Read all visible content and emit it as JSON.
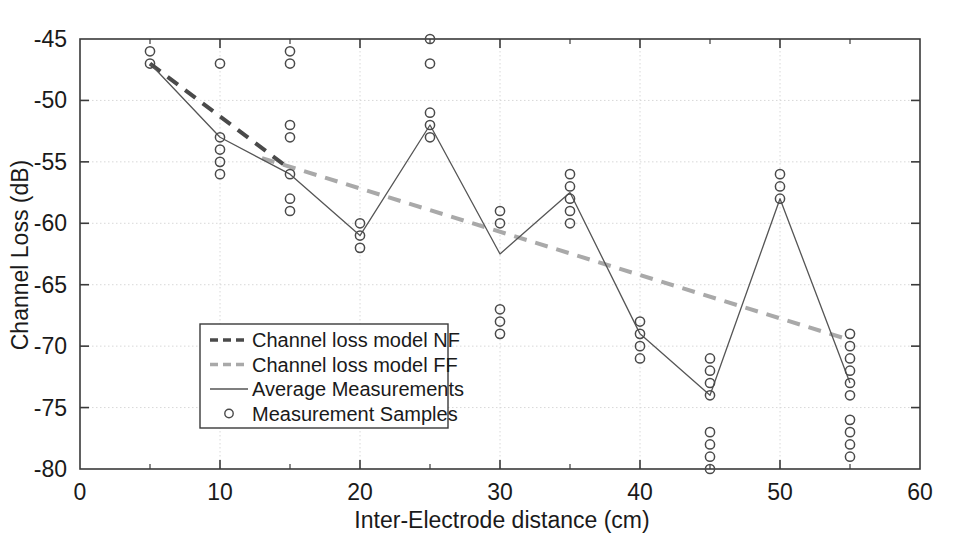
{
  "figure": {
    "background": "#ffffff",
    "plot_border_color": "#3a3a3a",
    "grid_color": "#d8d8d8"
  },
  "chart_data": {
    "type": "scatter",
    "title": "",
    "xlabel": "Inter-Electrode distance (cm)",
    "ylabel": "Channel Loss (dB)",
    "xlim": [
      0,
      60
    ],
    "ylim": [
      -80,
      -45
    ],
    "xticks": [
      0,
      10,
      20,
      30,
      40,
      50,
      60
    ],
    "xtick_labels": [
      "0",
      "10",
      "20",
      "30",
      "40",
      "50",
      "60"
    ],
    "yticks": [
      -80,
      -75,
      -70,
      -65,
      -60,
      -55,
      -50,
      -45
    ],
    "ytick_labels": [
      "-80",
      "-75",
      "-70",
      "-65",
      "-60",
      "-55",
      "-50",
      "-45"
    ],
    "xminor_ticks": [
      5,
      15,
      25,
      35,
      45,
      55
    ],
    "grid": true,
    "legend_position": "lower-left-inside",
    "series": [
      {
        "name": "Channel loss model NF",
        "type": "line",
        "style": "dashed",
        "color": "#4a4a4a",
        "width": 4,
        "x": [
          5,
          15
        ],
        "values": [
          -47.0,
          -55.6
        ]
      },
      {
        "name": "Channel loss model FF",
        "type": "line",
        "style": "dashed",
        "color": "#a9a9a9",
        "width": 4,
        "x": [
          13,
          55
        ],
        "values": [
          -54.7,
          -69.5
        ]
      },
      {
        "name": "Average Measurements",
        "type": "line",
        "style": "solid",
        "color": "#555555",
        "width": 1.3,
        "x": [
          5,
          10,
          15,
          20,
          25,
          30,
          35,
          40,
          45,
          50,
          55
        ],
        "values": [
          -47.0,
          -53.0,
          -56.0,
          -61.0,
          -52.0,
          -62.5,
          -57.5,
          -69.0,
          -74.0,
          -58.0,
          -73.0
        ]
      },
      {
        "name": "Measurement Samples",
        "type": "scatter",
        "marker": "circle-open",
        "color": "#4a4a4a",
        "points": [
          {
            "x": 5,
            "y": -46
          },
          {
            "x": 5,
            "y": -47
          },
          {
            "x": 10,
            "y": -47
          },
          {
            "x": 10,
            "y": -53
          },
          {
            "x": 10,
            "y": -54
          },
          {
            "x": 10,
            "y": -55
          },
          {
            "x": 10,
            "y": -56
          },
          {
            "x": 15,
            "y": -46
          },
          {
            "x": 15,
            "y": -47
          },
          {
            "x": 15,
            "y": -52
          },
          {
            "x": 15,
            "y": -53
          },
          {
            "x": 15,
            "y": -56
          },
          {
            "x": 15,
            "y": -58
          },
          {
            "x": 15,
            "y": -59
          },
          {
            "x": 20,
            "y": -60
          },
          {
            "x": 20,
            "y": -61
          },
          {
            "x": 20,
            "y": -62
          },
          {
            "x": 25,
            "y": -45
          },
          {
            "x": 25,
            "y": -47
          },
          {
            "x": 25,
            "y": -51
          },
          {
            "x": 25,
            "y": -52
          },
          {
            "x": 25,
            "y": -53
          },
          {
            "x": 30,
            "y": -59
          },
          {
            "x": 30,
            "y": -60
          },
          {
            "x": 30,
            "y": -67
          },
          {
            "x": 30,
            "y": -68
          },
          {
            "x": 30,
            "y": -69
          },
          {
            "x": 35,
            "y": -56
          },
          {
            "x": 35,
            "y": -57
          },
          {
            "x": 35,
            "y": -58
          },
          {
            "x": 35,
            "y": -59
          },
          {
            "x": 35,
            "y": -60
          },
          {
            "x": 40,
            "y": -68
          },
          {
            "x": 40,
            "y": -69
          },
          {
            "x": 40,
            "y": -70
          },
          {
            "x": 40,
            "y": -71
          },
          {
            "x": 45,
            "y": -71
          },
          {
            "x": 45,
            "y": -72
          },
          {
            "x": 45,
            "y": -73
          },
          {
            "x": 45,
            "y": -74
          },
          {
            "x": 45,
            "y": -77
          },
          {
            "x": 45,
            "y": -78
          },
          {
            "x": 45,
            "y": -79
          },
          {
            "x": 45,
            "y": -80
          },
          {
            "x": 50,
            "y": -56
          },
          {
            "x": 50,
            "y": -57
          },
          {
            "x": 50,
            "y": -58
          },
          {
            "x": 55,
            "y": -69
          },
          {
            "x": 55,
            "y": -70
          },
          {
            "x": 55,
            "y": -71
          },
          {
            "x": 55,
            "y": -72
          },
          {
            "x": 55,
            "y": -73
          },
          {
            "x": 55,
            "y": -74
          },
          {
            "x": 55,
            "y": -76
          },
          {
            "x": 55,
            "y": -77
          },
          {
            "x": 55,
            "y": -78
          },
          {
            "x": 55,
            "y": -79
          }
        ]
      }
    ],
    "legend": [
      {
        "label": "Channel loss model NF",
        "style": "dashed",
        "color": "#4a4a4a"
      },
      {
        "label": "Channel loss model FF",
        "style": "dashed",
        "color": "#a9a9a9"
      },
      {
        "label": "Average Measurements",
        "style": "solid",
        "color": "#555555"
      },
      {
        "label": "Measurement Samples",
        "style": "marker",
        "color": "#4a4a4a"
      }
    ]
  }
}
